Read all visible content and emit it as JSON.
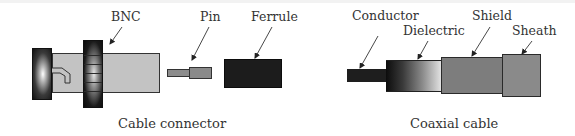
{
  "diagrams": [
    {
      "caption": "Cable connector",
      "labels": {
        "bnc": "BNC",
        "pin": "Pin",
        "ferrule": "Ferrule"
      }
    },
    {
      "caption": "Coaxial cable",
      "labels": {
        "conductor": "Conductor",
        "dielectric": "Dielectric",
        "shield": "Shield",
        "sheath": "Sheath"
      }
    }
  ],
  "colors": {
    "connector_body": "#c3c3c3",
    "ferrule": "#1c1c1c",
    "pin": "#8a8a8a",
    "conductor": "#1e1e1e",
    "shield": "#7d7d7d",
    "sheath": "#8a8a8a"
  }
}
